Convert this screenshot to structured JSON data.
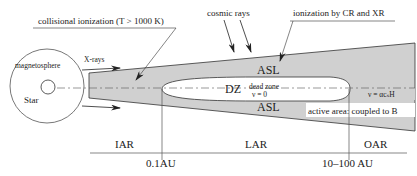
{
  "diagram": {
    "colors": {
      "disk_fill": "#d0d0d0",
      "line": "#333333",
      "background": "#ffffff",
      "dead_zone_fill": "#ffffff"
    },
    "annotations": {
      "collisional": "collisional ionization (T > 1000 K)",
      "cosmic_rays": "cosmic rays",
      "ionization_cr_xr": "ionization by CR and XR",
      "xrays": "X-rays",
      "magnetosphere": "magnetosphere",
      "star": "Star"
    },
    "regions": {
      "asl_top": "ASL",
      "asl_bottom": "ASL",
      "dz": "DZ",
      "dead_zone": "dead zone",
      "dead_zone_viscosity": "ν = 0",
      "active_viscosity": "ν = αcₛH",
      "active_area": "active area: coupled to B"
    },
    "axis": {
      "zones": [
        "IAR",
        "LAR",
        "OAR"
      ],
      "ticks": [
        "0.1AU",
        "10–100 AU"
      ]
    }
  }
}
